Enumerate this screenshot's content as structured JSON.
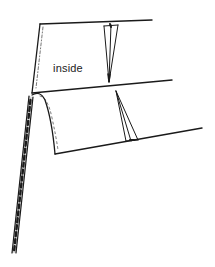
{
  "diagram": {
    "labels": {
      "inside": "inside"
    },
    "colors": {
      "line": "#1a1a1a",
      "background": "#ffffff"
    },
    "elements": [
      "upper-panel",
      "lower-panel-flap",
      "upper-dart",
      "lower-dart",
      "stitched-seam-edge"
    ]
  }
}
